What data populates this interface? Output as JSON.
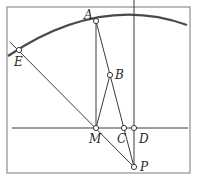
{
  "diagram": {
    "type": "geometry",
    "colors": {
      "stroke": "#3a3a3a",
      "arc": "#4a4a4a",
      "point_fill": "#ffffff",
      "frame": "#7a7a7a"
    },
    "points": {
      "A": {
        "label": "A",
        "x": 96,
        "y": 21
      },
      "B": {
        "label": "B",
        "x": 110,
        "y": 75
      },
      "C": {
        "label": "C",
        "x": 124,
        "y": 128
      },
      "D": {
        "label": "D",
        "x": 134,
        "y": 128
      },
      "E": {
        "label": "E",
        "x": 19,
        "y": 50
      },
      "M": {
        "label": "M",
        "x": 96,
        "y": 128
      },
      "P": {
        "label": "P",
        "x": 134,
        "y": 167
      }
    },
    "segments": [
      "E-P",
      "A-M",
      "A-P",
      "B-M",
      "D-P"
    ],
    "lines": [
      "horizontal line through M, C, D",
      "vertical line through D"
    ],
    "arc": "circular arc through E and A"
  }
}
